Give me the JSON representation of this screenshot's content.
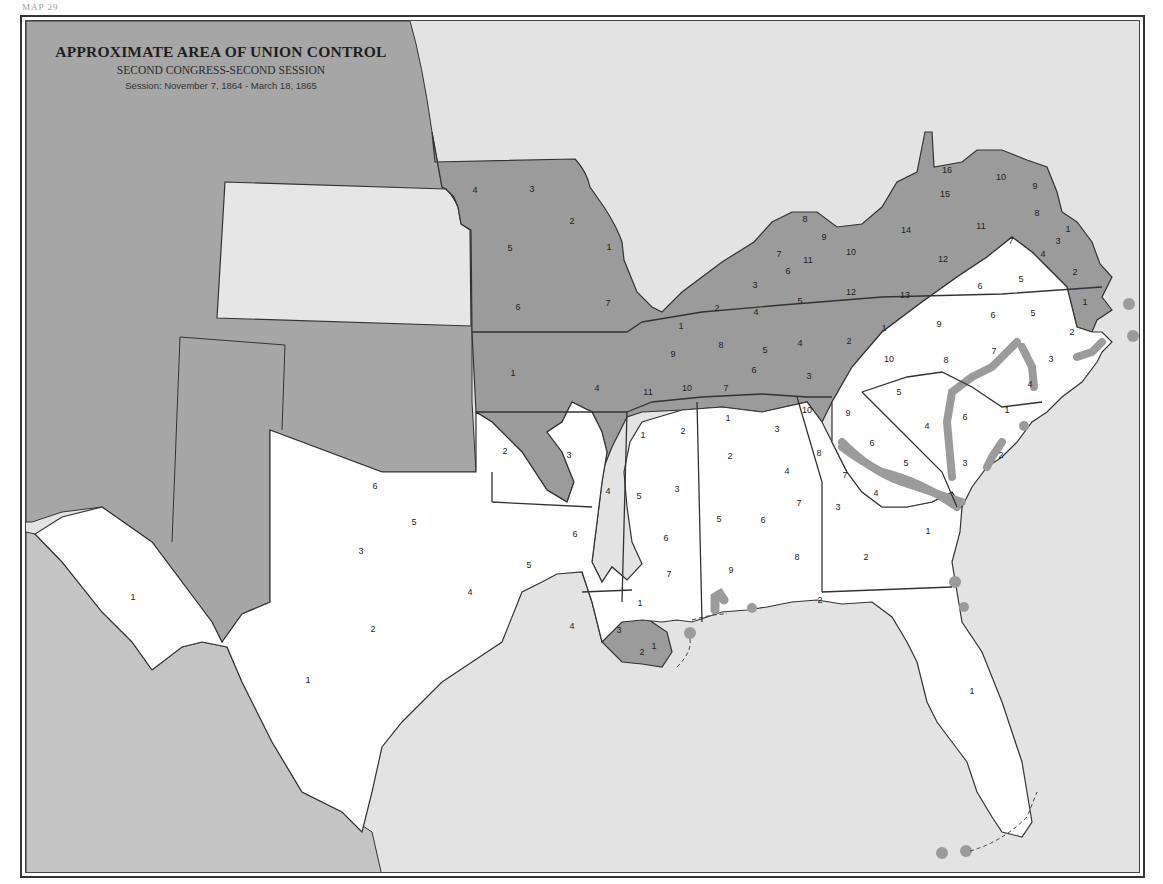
{
  "page": {
    "number_label": "MAP 29"
  },
  "title": {
    "main": "APPROXIMATE AREA OF UNION CONTROL",
    "subtitle": "SECOND CONGRESS-SECOND SESSION",
    "session": "Session: November 7, 1864 - March 18, 1865"
  },
  "colors": {
    "union_territory": "#9b9b9b",
    "confederate_territory": "#ffffff",
    "other_territory": "#a6a6a6",
    "kansas": "#e6e6e6",
    "water": "#e3e3e3",
    "union_control_band": "#9b9b9b",
    "union_outposts": "#9b9b9b",
    "border": "#333333"
  },
  "legend": {
    "shaded": "Area of Union control",
    "unshaded": "Area of Confederate control"
  },
  "districts": {
    "missouri": [
      {
        "n": "4",
        "x": 473,
        "y": 189
      },
      {
        "n": "3",
        "x": 530,
        "y": 188
      },
      {
        "n": "2",
        "x": 570,
        "y": 220
      },
      {
        "n": "5",
        "x": 508,
        "y": 247
      },
      {
        "n": "1",
        "x": 607,
        "y": 246
      },
      {
        "n": "6",
        "x": 516,
        "y": 306
      },
      {
        "n": "7",
        "x": 606,
        "y": 302
      }
    ],
    "kentucky": [
      {
        "n": "8",
        "x": 803,
        "y": 218
      },
      {
        "n": "9",
        "x": 822,
        "y": 236
      },
      {
        "n": "10",
        "x": 849,
        "y": 251
      },
      {
        "n": "7",
        "x": 777,
        "y": 253
      },
      {
        "n": "11",
        "x": 806,
        "y": 259
      },
      {
        "n": "6",
        "x": 786,
        "y": 270
      },
      {
        "n": "3",
        "x": 753,
        "y": 284
      },
      {
        "n": "2",
        "x": 715,
        "y": 307
      },
      {
        "n": "5",
        "x": 798,
        "y": 300
      },
      {
        "n": "12",
        "x": 849,
        "y": 291
      },
      {
        "n": "4",
        "x": 754,
        "y": 311
      },
      {
        "n": "1",
        "x": 679,
        "y": 325
      }
    ],
    "tennessee": [
      {
        "n": "9",
        "x": 671,
        "y": 353
      },
      {
        "n": "8",
        "x": 719,
        "y": 344
      },
      {
        "n": "5",
        "x": 763,
        "y": 349
      },
      {
        "n": "4",
        "x": 798,
        "y": 342
      },
      {
        "n": "2",
        "x": 847,
        "y": 340
      },
      {
        "n": "1",
        "x": 882,
        "y": 327
      },
      {
        "n": "6",
        "x": 752,
        "y": 369
      },
      {
        "n": "3",
        "x": 807,
        "y": 375
      },
      {
        "n": "11",
        "x": 646,
        "y": 391
      },
      {
        "n": "10",
        "x": 685,
        "y": 387
      },
      {
        "n": "7",
        "x": 724,
        "y": 387
      }
    ],
    "virginia": [
      {
        "n": "16",
        "x": 945,
        "y": 169
      },
      {
        "n": "10",
        "x": 999,
        "y": 176
      },
      {
        "n": "9",
        "x": 1033,
        "y": 185
      },
      {
        "n": "15",
        "x": 943,
        "y": 193
      },
      {
        "n": "8",
        "x": 1035,
        "y": 212
      },
      {
        "n": "11",
        "x": 979,
        "y": 225
      },
      {
        "n": "14",
        "x": 904,
        "y": 229
      },
      {
        "n": "1",
        "x": 1066,
        "y": 228
      },
      {
        "n": "7",
        "x": 1009,
        "y": 240
      },
      {
        "n": "3",
        "x": 1056,
        "y": 240
      },
      {
        "n": "4",
        "x": 1041,
        "y": 253
      },
      {
        "n": "12",
        "x": 941,
        "y": 258
      },
      {
        "n": "2",
        "x": 1073,
        "y": 271
      },
      {
        "n": "5",
        "x": 1019,
        "y": 278
      },
      {
        "n": "6",
        "x": 978,
        "y": 285
      },
      {
        "n": "13",
        "x": 903,
        "y": 294
      }
    ],
    "north_carolina": [
      {
        "n": "1",
        "x": 1083,
        "y": 301
      },
      {
        "n": "6",
        "x": 991,
        "y": 314
      },
      {
        "n": "5",
        "x": 1031,
        "y": 312
      },
      {
        "n": "9",
        "x": 937,
        "y": 323
      },
      {
        "n": "2",
        "x": 1070,
        "y": 331
      },
      {
        "n": "10",
        "x": 887,
        "y": 358
      },
      {
        "n": "8",
        "x": 944,
        "y": 359
      },
      {
        "n": "7",
        "x": 992,
        "y": 350
      },
      {
        "n": "3",
        "x": 1049,
        "y": 358
      },
      {
        "n": "4",
        "x": 1028,
        "y": 383
      }
    ],
    "south_carolina": [
      {
        "n": "5",
        "x": 897,
        "y": 391
      },
      {
        "n": "4",
        "x": 925,
        "y": 425
      },
      {
        "n": "1",
        "x": 1005,
        "y": 409
      },
      {
        "n": "6",
        "x": 963,
        "y": 416
      },
      {
        "n": "3",
        "x": 963,
        "y": 462
      },
      {
        "n": "2",
        "x": 999,
        "y": 454
      },
      {
        "n": "9",
        "x": 846,
        "y": 412
      },
      {
        "n": "6",
        "x": 870,
        "y": 442
      },
      {
        "n": "5",
        "x": 904,
        "y": 462
      }
    ],
    "georgia": [
      {
        "n": "10",
        "x": 805,
        "y": 409
      },
      {
        "n": "8",
        "x": 817,
        "y": 452
      },
      {
        "n": "7",
        "x": 843,
        "y": 474
      },
      {
        "n": "4",
        "x": 874,
        "y": 492
      },
      {
        "n": "3",
        "x": 836,
        "y": 506
      },
      {
        "n": "1",
        "x": 926,
        "y": 530
      },
      {
        "n": "2",
        "x": 864,
        "y": 556
      }
    ],
    "alabama": [
      {
        "n": "1",
        "x": 726,
        "y": 417
      },
      {
        "n": "3",
        "x": 775,
        "y": 428
      },
      {
        "n": "2",
        "x": 728,
        "y": 455
      },
      {
        "n": "4",
        "x": 785,
        "y": 470
      },
      {
        "n": "7",
        "x": 797,
        "y": 502
      },
      {
        "n": "5",
        "x": 717,
        "y": 518
      },
      {
        "n": "6",
        "x": 761,
        "y": 519
      },
      {
        "n": "9",
        "x": 729,
        "y": 569
      },
      {
        "n": "8",
        "x": 795,
        "y": 556
      }
    ],
    "mississippi": [
      {
        "n": "1",
        "x": 641,
        "y": 434
      },
      {
        "n": "2",
        "x": 681,
        "y": 430
      },
      {
        "n": "5",
        "x": 637,
        "y": 495
      },
      {
        "n": "3",
        "x": 675,
        "y": 488
      },
      {
        "n": "6",
        "x": 664,
        "y": 537
      },
      {
        "n": "7",
        "x": 667,
        "y": 573
      },
      {
        "n": "4",
        "x": 606,
        "y": 490
      }
    ],
    "arkansas": [
      {
        "n": "1",
        "x": 511,
        "y": 372
      },
      {
        "n": "4",
        "x": 595,
        "y": 387
      },
      {
        "n": "2",
        "x": 503,
        "y": 450
      },
      {
        "n": "3",
        "x": 567,
        "y": 454
      },
      {
        "n": "5",
        "x": 527,
        "y": 564
      },
      {
        "n": "6",
        "x": 573,
        "y": 533
      }
    ],
    "louisiana": [
      {
        "n": "4",
        "x": 570,
        "y": 625
      },
      {
        "n": "3",
        "x": 617,
        "y": 629
      },
      {
        "n": "1",
        "x": 638,
        "y": 602
      },
      {
        "n": "2",
        "x": 640,
        "y": 651
      },
      {
        "n": "1",
        "x": 652,
        "y": 645
      }
    ],
    "texas": [
      {
        "n": "6",
        "x": 373,
        "y": 485
      },
      {
        "n": "5",
        "x": 412,
        "y": 521
      },
      {
        "n": "3",
        "x": 359,
        "y": 550
      },
      {
        "n": "4",
        "x": 468,
        "y": 591
      },
      {
        "n": "2",
        "x": 371,
        "y": 628
      },
      {
        "n": "1",
        "x": 131,
        "y": 596
      },
      {
        "n": "1",
        "x": 306,
        "y": 679
      }
    ],
    "florida": [
      {
        "n": "2",
        "x": 818,
        "y": 599
      },
      {
        "n": "1",
        "x": 970,
        "y": 690
      }
    ],
    "indian_territory": [
      {
        "n": "1",
        "x": 511,
        "y": 372
      }
    ]
  }
}
